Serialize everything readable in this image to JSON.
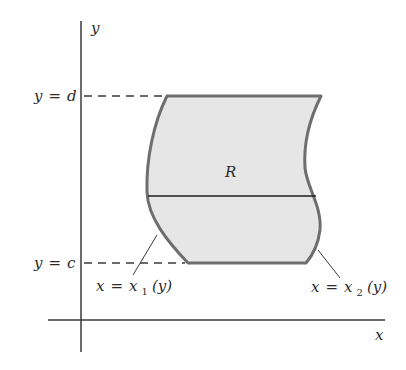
{
  "figure": {
    "axes": {
      "x_label": "x",
      "y_label": "y"
    },
    "bounds": {
      "upper": {
        "var": "y",
        "eq": "=",
        "val": "d"
      },
      "lower": {
        "var": "y",
        "eq": "=",
        "val": "c"
      }
    },
    "region": {
      "label": "R",
      "fill_color": "#e6e6e6",
      "stroke_color": "#6e6e6e"
    },
    "curves": {
      "left": {
        "lhs": "x",
        "eq": "=",
        "fn": "x",
        "sub": "1",
        "arg": "(y)"
      },
      "right": {
        "lhs": "x",
        "eq": "=",
        "fn": "x",
        "sub": "2",
        "arg": "(y)"
      }
    },
    "colors": {
      "axis": "#3a3a3a",
      "text": "#2b2b2b",
      "slice_line": "#1e1e1e"
    }
  }
}
